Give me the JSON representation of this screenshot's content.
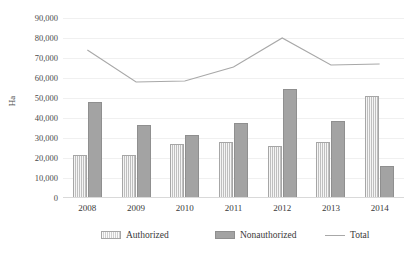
{
  "chart_data": {
    "type": "bar",
    "title": "",
    "subtitle": "",
    "xlabel": "",
    "ylabel": "Ha",
    "categories": [
      "2008",
      "2009",
      "2010",
      "2011",
      "2012",
      "2013",
      "2014"
    ],
    "ylim": [
      0,
      90000
    ],
    "ytick_step": 10000,
    "ytick_labels": [
      "90,000",
      "80,000",
      "70,000",
      "60,000",
      "50,000",
      "40,000",
      "30,000",
      "20,000",
      "10,000",
      "0"
    ],
    "ytick_values": [
      90000,
      80000,
      70000,
      60000,
      50000,
      40000,
      30000,
      20000,
      10000,
      0
    ],
    "grid": true,
    "legend_position": "bottom",
    "series": [
      {
        "name": "Authorized",
        "type": "bar",
        "color": "#bfbfbf",
        "pattern": "vertical-hatch",
        "values": [
          21500,
          21500,
          27000,
          28000,
          26000,
          28000,
          51000
        ]
      },
      {
        "name": "Nonauthorized",
        "type": "bar",
        "color": "#a3a3a3",
        "pattern": "solid",
        "values": [
          48000,
          36500,
          31500,
          37500,
          54500,
          38500,
          16000
        ]
      },
      {
        "name": "Total",
        "type": "line",
        "color": "#a8a8a8",
        "values": [
          74000,
          58000,
          58500,
          65500,
          80000,
          66500,
          67000
        ]
      }
    ]
  },
  "legend": {
    "items": [
      {
        "label": "Authorized",
        "marker": "hatched-swatch-icon"
      },
      {
        "label": "Nonauthorized",
        "marker": "solid-swatch-icon"
      },
      {
        "label": "Total",
        "marker": "line-swatch-icon"
      }
    ]
  }
}
